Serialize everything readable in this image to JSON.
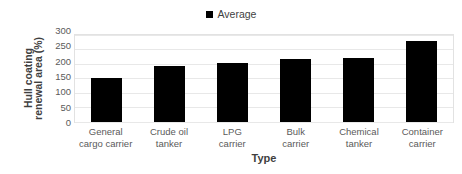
{
  "chart_data": {
    "type": "bar",
    "title": "",
    "subtitle": "",
    "xlabel": "Type",
    "ylabel": "Hull coating renewal area (%)",
    "ylabel_lines": [
      "Hull coating",
      "renewal area (%)"
    ],
    "categories": [
      "General cargo carrier",
      "Crude oil tanker",
      "LPG carrier",
      "Bulk carrier",
      "Chemical tanker",
      "Container carrier"
    ],
    "category_lines": [
      [
        "General",
        "cargo carrier"
      ],
      [
        "Crude oil",
        "tanker"
      ],
      [
        "LPG",
        "carrier"
      ],
      [
        "Bulk",
        "carrier"
      ],
      [
        "Chemical",
        "tanker"
      ],
      [
        "Container",
        "carrier"
      ]
    ],
    "series": [
      {
        "name": "Average",
        "color": "#000000",
        "values": [
          153,
          192,
          202,
          216,
          221,
          281
        ]
      }
    ],
    "ylim": [
      0,
      300
    ],
    "yticks": [
      300,
      250,
      200,
      150,
      100,
      50,
      0
    ],
    "ytick_labels": [
      "300",
      "250",
      "200",
      "150",
      "100",
      "50",
      "0"
    ],
    "grid": true,
    "grid_axis": "y",
    "legend": {
      "position": "top-center",
      "entries": [
        {
          "label": "Average",
          "color": "#000000",
          "marker": "square"
        }
      ]
    },
    "colors": {
      "bar": "#0a0a0a",
      "gridline": "#e8e8e8",
      "plot_border": "#e2e2e2",
      "text": "#3f3f3f",
      "tick_text": "#5a5a5a",
      "background": "#ffffff"
    }
  }
}
